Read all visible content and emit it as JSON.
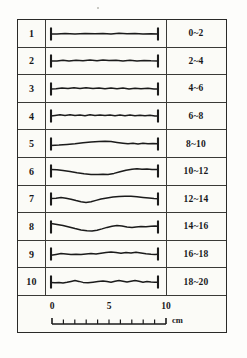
{
  "figure": {
    "title": "",
    "columns": [
      "no",
      "profile",
      "depth_range"
    ],
    "line_color": "#1b1b1b",
    "frame_color": "#2a2a28",
    "background_color": "#fbfbf7",
    "rows": [
      {
        "no": "1",
        "range": "0~2",
        "profile": "M6,14 L12,14 L20,13.6 L30,13.9 L40,13.5 L50,13.8 L58,13.4 L66,13.9 L74,13.3 L82,13.8 L90,13.5 L98,13.9 L106,13.7 L113,14"
      },
      {
        "no": "2",
        "range": "2~4",
        "profile": "M6,14 L12,14 L18,13.3 L24,13.9 L31,13.2 L38,13.8 L45,13.1 L52,13.7 L58,12.9 L64,13.5 L71,13.2 L78,13.9 L85,13.3 L92,13.9 L99,13.4 L106,13.8 L113,14"
      },
      {
        "no": "3",
        "range": "4~6",
        "profile": "M6,14 L11,13.8 L17,13 L23,13.6 L29,12.8 L35,13.5 L41,12.7 L48,13.4 L54,12.9 L60,13.7 L66,13 L72,13.8 L78,13.1 L84,13.9 L90,13.2 L96,13.8 L103,13.3 L109,13.9 L113,14"
      },
      {
        "no": "4",
        "range": "6~8",
        "profile": "M6,14 L10,13.4 L15,12.7 L20,13.5 L25,12.8 L30,13.6 L35,12.9 L40,13.7 L45,12.8 L50,13.5 L55,12.9 L60,13.6 L65,13 L70,13.7 L75,13.1 L80,13.8 L85,13.1 L90,13.7 L95,13.2 L100,13.8 L105,13.3 L110,13.9 L113,14"
      },
      {
        "no": "5",
        "range": "8~10",
        "profile": "M6,15.4 L14,15 L22,14.4 L30,13.7 L38,12.8 L46,11.9 L54,11.4 L60,11.2 L66,11.6 L72,12.4 L78,13.2 L83,13.8 L88,13.3 L93,13.9 L98,13.3 L103,13.8 L108,13.4 L113,13.7"
      },
      {
        "no": "6",
        "range": "10~12",
        "profile": "M6,12.4 L12,12.8 L18,13.6 L25,14.6 L32,15.8 L39,16.8 L46,17.4 L53,17.6 L58,17.3 L63,17.4 L69,16.4 L75,14.8 L81,13.2 L87,12.2 L92,11.8 L97,12.3 L102,12 L107,12.6 L113,12.4"
      },
      {
        "no": "7",
        "range": "12~14",
        "profile": "M6,13.6 L11,13.2 L16,12.6 L21,13.2 L26,14.2 L31,15.6 L36,16.8 L41,17.4 L46,16.8 L51,15.4 L56,14 L62,12.9 L68,12.1 L74,11.5 L80,11.2 L86,11.3 L92,11.7 L98,12.4 L104,13.1 L109,13.6 L113,13.8"
      },
      {
        "no": "8",
        "range": "14~16",
        "profile": "M6,10.6 L12,11.4 L18,12.6 L24,14 L30,15.6 L36,16.9 L42,17.7 L47,17.9 L52,17.2 L57,15.9 L62,14.4 L67,13.2 L72,12.4 L77,12.9 L82,13.9 L87,14.6 L91,13.9 L96,13.4 L101,13.7 L106,13.3 L110,13.1 L113,13.2"
      },
      {
        "no": "9",
        "range": "16~18",
        "profile": "M6,15.2 L11,14.4 L16,13.6 L21,14 L26,14.6 L31,14.2 L36,14.5 L41,14 L46,13.6 L51,13.9 L56,13.2 L61,12.6 L66,11.9 L71,12.6 L76,13.2 L81,12.4 L86,13 L91,12.3 L96,13 L101,13.8 L106,14.2 L110,14.4 L113,14.3"
      },
      {
        "no": "10",
        "range": "18~20",
        "profile": "M6,14.6 L10,14.8 L14,14.4 L18,14.9 L22,14.3 L26,13.4 L30,12.6 L34,13.4 L38,14.4 L43,14.7 L48,14.2 L53,13.6 L58,13 L62,13.6 L66,14.2 L70,13.2 L74,12.4 L78,13.2 L82,14.1 L86,13.3 L90,12.5 L94,13.3 L98,14.2 L102,13.6 L106,14 L110,14.3 L113,14.2"
      }
    ],
    "scale": {
      "unit": "cm",
      "tick_labels": [
        "0",
        "5",
        "10"
      ],
      "tick_label_values": [
        0,
        5,
        10
      ],
      "minor_tick_interval": 1,
      "min": 0,
      "max": 10
    }
  }
}
